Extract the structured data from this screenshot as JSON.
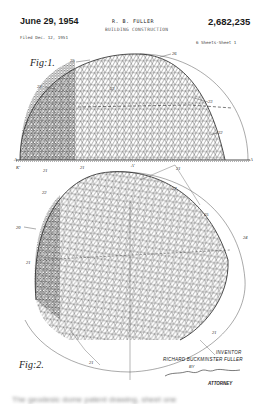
{
  "header": {
    "date": "June 29, 1954",
    "inventor": "R. B. FULLER",
    "title": "BUILDING CONSTRUCTION",
    "patent_number": "2,682,235",
    "filed": "Filed Dec. 12, 1951",
    "sheets": "6 Sheets-Sheet 1"
  },
  "figures": {
    "fig1_label": "Fig:1.",
    "fig2_label": "Fig:2."
  },
  "reference_numerals": {
    "fig1": [
      "25",
      "26",
      "22",
      "23",
      "23",
      "22",
      "21",
      "21",
      "21",
      "21",
      "A",
      "A",
      "A'",
      "K'"
    ],
    "fig2": [
      "22",
      "20",
      "27",
      "25",
      "24",
      "21",
      "21",
      "21"
    ]
  },
  "signature_block": {
    "inventor_label": "INVENTOR",
    "inventor_name": "RICHARD BUCKMINSTER FULLER",
    "by": "BY",
    "attorney_label": "ATTORNEY"
  },
  "caption": "The geodesic dome patent drawing, sheet one"
}
